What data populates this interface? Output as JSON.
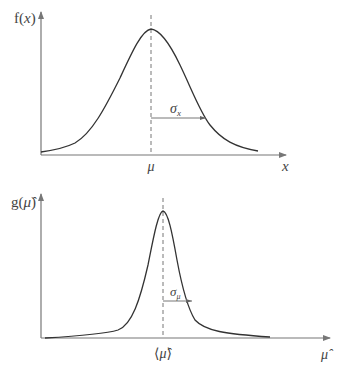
{
  "colors": {
    "background": "#ffffff",
    "curve": "#333333",
    "axis": "#777777",
    "text": "#444444"
  },
  "top_plot": {
    "ylabel_func": "f",
    "ylabel_open": "(",
    "ylabel_var": "x",
    "ylabel_close": ")",
    "xlabel": "x",
    "center_label": "μ",
    "width_label_main": "σ",
    "width_label_sub": "x"
  },
  "bottom_plot": {
    "ylabel_func": "g",
    "ylabel_open": "(",
    "ylabel_var": "μ̂",
    "ylabel_close": ")",
    "xlabel": "μ̂",
    "center_label_open": "⟨",
    "center_label_var": "μ̂",
    "center_label_close": "⟩",
    "width_label_main": "σ",
    "width_label_sub": "μ"
  }
}
